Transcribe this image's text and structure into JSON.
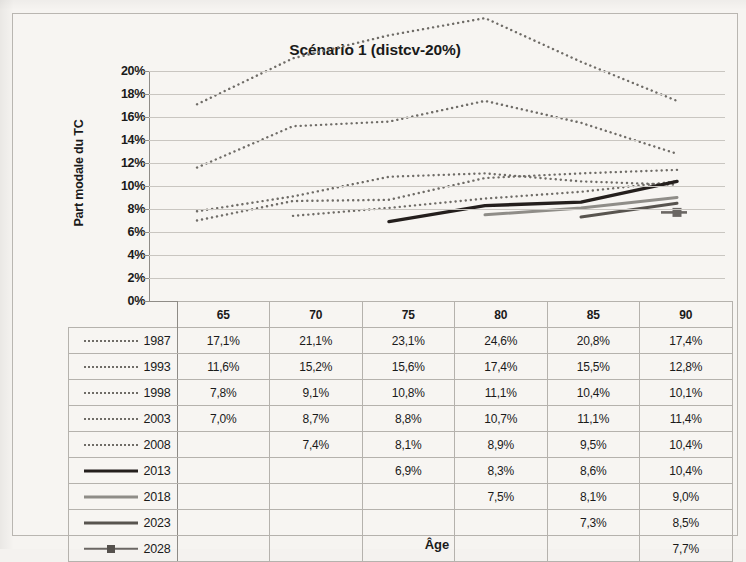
{
  "chart_data": {
    "type": "line",
    "title": "Scénario 1 (distcv-20%)",
    "xlabel": "Âge",
    "ylabel": "Part modale du TC",
    "categories": [
      65,
      70,
      75,
      80,
      85,
      90
    ],
    "ytick_labels": [
      "20%",
      "18%",
      "16%",
      "14%",
      "12%",
      "10%",
      "8%",
      "6%",
      "4%",
      "2%",
      "0%"
    ],
    "ytick_values": [
      20,
      18,
      16,
      14,
      12,
      10,
      8,
      6,
      4,
      2,
      0
    ],
    "ylim": [
      0,
      20
    ],
    "xlim": [
      62.5,
      92.5
    ],
    "grid": true,
    "legend_position": "table-left",
    "series": [
      {
        "name": "1987",
        "style": "dotted",
        "color": "#6f6c67",
        "values": [
          17.1,
          21.1,
          23.1,
          24.6,
          20.8,
          17.4
        ],
        "labels": [
          "17,1%",
          "21,1%",
          "23,1%",
          "24,6%",
          "20,8%",
          "17,4%"
        ]
      },
      {
        "name": "1993",
        "style": "dotted",
        "color": "#6f6c67",
        "values": [
          11.6,
          15.2,
          15.6,
          17.4,
          15.5,
          12.8
        ],
        "labels": [
          "11,6%",
          "15,2%",
          "15,6%",
          "17,4%",
          "15,5%",
          "12,8%"
        ]
      },
      {
        "name": "1998",
        "style": "dotted",
        "color": "#6f6c67",
        "values": [
          7.8,
          9.1,
          10.8,
          11.1,
          10.4,
          10.1
        ],
        "labels": [
          "7,8%",
          "9,1%",
          "10,8%",
          "11,1%",
          "10,4%",
          "10,1%"
        ]
      },
      {
        "name": "2003",
        "style": "dotted",
        "color": "#6f6c67",
        "values": [
          7.0,
          8.7,
          8.8,
          10.7,
          11.1,
          11.4
        ],
        "labels": [
          "7,0%",
          "8,7%",
          "8,8%",
          "10,7%",
          "11,1%",
          "11,4%"
        ]
      },
      {
        "name": "2008",
        "style": "dotted",
        "color": "#6f6c67",
        "values": [
          null,
          7.4,
          8.1,
          8.9,
          9.5,
          10.4
        ],
        "labels": [
          "",
          "7,4%",
          "8,1%",
          "8,9%",
          "9,5%",
          "10,4%"
        ]
      },
      {
        "name": "2013",
        "style": "solid-dark",
        "color": "#241f1d",
        "values": [
          null,
          null,
          6.9,
          8.3,
          8.6,
          10.4
        ],
        "labels": [
          "",
          "",
          "6,9%",
          "8,3%",
          "8,6%",
          "10,4%"
        ]
      },
      {
        "name": "2018",
        "style": "solid-light",
        "color": "#8f8d88",
        "values": [
          null,
          null,
          null,
          7.5,
          8.1,
          9.0
        ],
        "labels": [
          "",
          "",
          "",
          "7,5%",
          "8,1%",
          "9,0%"
        ]
      },
      {
        "name": "2023",
        "style": "solid-mid",
        "color": "#58544f",
        "values": [
          null,
          null,
          null,
          null,
          7.3,
          8.5
        ],
        "labels": [
          "",
          "",
          "",
          "",
          "7,3%",
          "8,5%"
        ]
      },
      {
        "name": "2028",
        "style": "solid-marker",
        "color": "#6b6764",
        "values": [
          null,
          null,
          null,
          null,
          null,
          7.7
        ],
        "labels": [
          "",
          "",
          "",
          "",
          "",
          "7,7%"
        ]
      }
    ]
  },
  "table": {
    "column_headers": [
      "",
      "65",
      "70",
      "75",
      "80",
      "85",
      "90"
    ],
    "rows": [
      {
        "label": "1987",
        "swatch": "dotted-line-swatch",
        "cells": [
          "17,1%",
          "21,1%",
          "23,1%",
          "24,6%",
          "20,8%",
          "17,4%"
        ]
      },
      {
        "label": "1993",
        "swatch": "dotted-line-swatch",
        "cells": [
          "11,6%",
          "15,2%",
          "15,6%",
          "17,4%",
          "15,5%",
          "12,8%"
        ]
      },
      {
        "label": "1998",
        "swatch": "dotted-line-swatch",
        "cells": [
          "7,8%",
          "9,1%",
          "10,8%",
          "11,1%",
          "10,4%",
          "10,1%"
        ]
      },
      {
        "label": "2003",
        "swatch": "dotted-line-swatch",
        "cells": [
          "7,0%",
          "8,7%",
          "8,8%",
          "10,7%",
          "11,1%",
          "11,4%"
        ]
      },
      {
        "label": "2008",
        "swatch": "dotted-line-swatch",
        "cells": [
          "",
          "7,4%",
          "8,1%",
          "8,9%",
          "9,5%",
          "10,4%"
        ]
      },
      {
        "label": "2013",
        "swatch": "solid-dark-line-swatch",
        "cells": [
          "",
          "",
          "6,9%",
          "8,3%",
          "8,6%",
          "10,4%"
        ]
      },
      {
        "label": "2018",
        "swatch": "solid-light-line-swatch",
        "cells": [
          "",
          "",
          "",
          "7,5%",
          "8,1%",
          "9,0%"
        ]
      },
      {
        "label": "2023",
        "swatch": "solid-mid-line-swatch",
        "cells": [
          "",
          "",
          "",
          "",
          "7,3%",
          "8,5%"
        ]
      },
      {
        "label": "2028",
        "swatch": "solid-marker-line-swatch",
        "cells": [
          "",
          "",
          "",
          "",
          "",
          "7,7%"
        ]
      }
    ]
  }
}
